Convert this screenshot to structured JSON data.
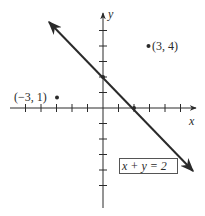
{
  "figure": {
    "axes": {
      "x_label": "x",
      "y_label": "y",
      "tick_spacing_units": 1,
      "x_ticks": [
        -5,
        -4,
        -3,
        -2,
        -1,
        1,
        2,
        3,
        4,
        5
      ],
      "y_ticks": [
        5,
        4,
        3,
        2,
        1,
        -1,
        -2,
        -3,
        -4,
        -5
      ]
    },
    "line": {
      "equation_label": "x + y = 2",
      "intercepts": [
        {
          "x": 0,
          "y": 2
        },
        {
          "x": 2,
          "y": 0
        }
      ]
    },
    "points": [
      {
        "x": 3,
        "y": 4,
        "label": "(3, 4)"
      },
      {
        "x": -3,
        "y": 1,
        "label": "(−3, 1)"
      }
    ],
    "colors": {
      "ink": "#2a2a2a",
      "background": "#ffffff"
    }
  }
}
